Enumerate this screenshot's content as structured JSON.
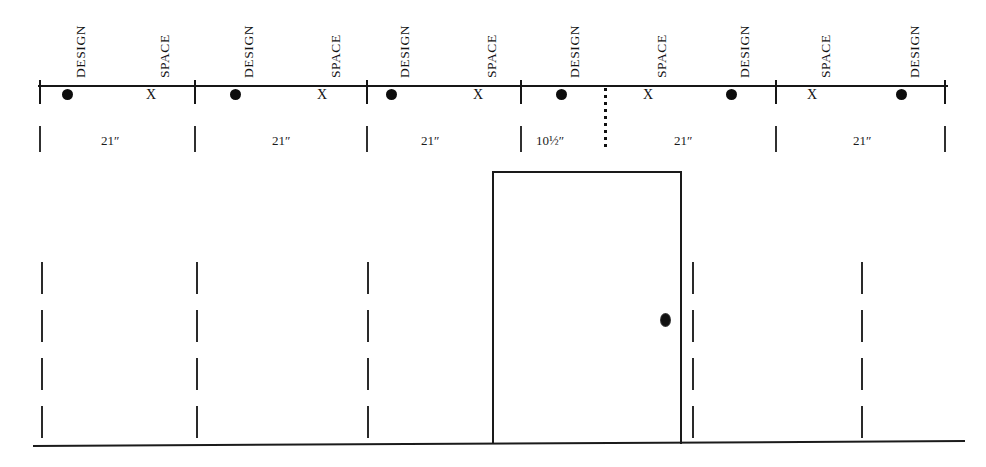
{
  "diagram": {
    "units": "inches",
    "colors": {
      "line": "#1a1a1a",
      "text": "#131313",
      "background": "#ffffff"
    },
    "scale": {
      "markers": [
        {
          "kind": "design",
          "label": "DESIGN",
          "glyph": "●",
          "x": 67
        },
        {
          "kind": "space",
          "label": "SPACE",
          "glyph": "X",
          "x": 151
        },
        {
          "kind": "design",
          "label": "DESIGN",
          "glyph": "●",
          "x": 235
        },
        {
          "kind": "space",
          "label": "SPACE",
          "glyph": "X",
          "x": 322
        },
        {
          "kind": "design",
          "label": "DESIGN",
          "glyph": "●",
          "x": 391
        },
        {
          "kind": "space",
          "label": "SPACE",
          "glyph": "X",
          "x": 478
        },
        {
          "kind": "design",
          "label": "DESIGN",
          "glyph": "●",
          "x": 561
        },
        {
          "kind": "space",
          "label": "SPACE",
          "glyph": "X",
          "x": 648
        },
        {
          "kind": "design",
          "label": "DESIGN",
          "glyph": "●",
          "x": 731
        },
        {
          "kind": "space",
          "label": "SPACE",
          "glyph": "X",
          "x": 812
        },
        {
          "kind": "design",
          "label": "DESIGN",
          "glyph": "●",
          "x": 901
        }
      ],
      "ticks": [
        40,
        195,
        367,
        521,
        776,
        945
      ],
      "break_marker": {
        "glyph": "⋮",
        "x": 604
      }
    },
    "dimensions": [
      {
        "value": "21″",
        "center": 110
      },
      {
        "value": "21″",
        "center": 281
      },
      {
        "value": "21″",
        "center": 430
      },
      {
        "value": "10½″",
        "center": 550
      },
      {
        "value": "21″",
        "center": 683
      },
      {
        "value": "21″",
        "center": 862
      }
    ],
    "dimension_ticks": [
      40,
      195,
      367,
      521,
      776,
      945
    ],
    "door": {
      "label": "Door opening",
      "x": 492,
      "y": 171,
      "width": 190,
      "height": 273,
      "knob": {
        "label": "Doorknob",
        "x": 659,
        "y": 312
      }
    },
    "studs": [
      {
        "x": 41,
        "label": "stud-1"
      },
      {
        "x": 196,
        "label": "stud-2"
      },
      {
        "x": 367,
        "label": "stud-3"
      },
      {
        "x": 522,
        "label": "stud-4"
      },
      {
        "x": 692,
        "label": "stud-5"
      },
      {
        "x": 861,
        "label": "stud-6"
      }
    ],
    "stud_dashes": {
      "count": 4,
      "top": 262,
      "dash_height": 32,
      "gap": 16
    },
    "floor": {
      "label": "Floor line",
      "y": 443,
      "x1": 33,
      "x2": 965
    }
  }
}
